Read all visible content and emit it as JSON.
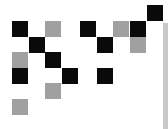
{
  "board": {
    "origin": {
      "x": 12,
      "y": 5
    },
    "pitch": {
      "col": 16.9,
      "row": 15.7
    },
    "cell_size": 16,
    "colors": {
      "black": "#0a0a0a",
      "gray": "#a0a0a0",
      "background": "#ffffff",
      "side_bar": "#c8c8c8"
    },
    "cells": [
      {
        "row": 0,
        "col": 8,
        "state": "black"
      },
      {
        "row": 1,
        "col": 0,
        "state": "black"
      },
      {
        "row": 1,
        "col": 2,
        "state": "gray"
      },
      {
        "row": 1,
        "col": 4,
        "state": "black"
      },
      {
        "row": 1,
        "col": 6,
        "state": "gray"
      },
      {
        "row": 1,
        "col": 7,
        "state": "black"
      },
      {
        "row": 2,
        "col": 1,
        "state": "black"
      },
      {
        "row": 2,
        "col": 5,
        "state": "black"
      },
      {
        "row": 2,
        "col": 7,
        "state": "gray"
      },
      {
        "row": 3,
        "col": 0,
        "state": "gray"
      },
      {
        "row": 3,
        "col": 2,
        "state": "black"
      },
      {
        "row": 4,
        "col": 0,
        "state": "black"
      },
      {
        "row": 4,
        "col": 3,
        "state": "black"
      },
      {
        "row": 4,
        "col": 5,
        "state": "black"
      },
      {
        "row": 5,
        "col": 2,
        "state": "gray"
      },
      {
        "row": 6,
        "col": 0,
        "state": "gray"
      }
    ]
  }
}
